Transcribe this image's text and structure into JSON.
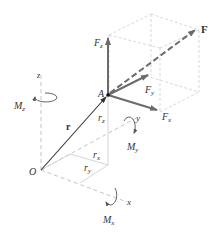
{
  "diagram": {
    "type": "3d-moment-components",
    "colors": {
      "background": "#ffffff",
      "force": "#6b6b6b",
      "guide": "#c9c9c9",
      "axis": "#b5b5b5",
      "position_vector": "#333333",
      "text": "#333333"
    },
    "points": {
      "O": "origin",
      "A": "point of force application"
    },
    "labels": {
      "F": "F",
      "Fz": {
        "main": "F",
        "sub": "z"
      },
      "Fy": {
        "main": "F",
        "sub": "y"
      },
      "Fx": {
        "main": "F",
        "sub": "x"
      },
      "A": "A",
      "O": "O",
      "r": "r",
      "rz": {
        "main": "r",
        "sub": "z"
      },
      "rx": {
        "main": "r",
        "sub": "x"
      },
      "ry": {
        "main": "r",
        "sub": "y"
      },
      "Mz": {
        "main": "M",
        "sub": "z"
      },
      "My": {
        "main": "M",
        "sub": "y"
      },
      "Mx": {
        "main": "M",
        "sub": "x"
      },
      "axis_z": "z",
      "axis_y": "y",
      "axis_x": "x"
    },
    "vectors": [
      {
        "name": "F",
        "style": "dashed",
        "from": "A",
        "to": "F-tip"
      },
      {
        "name": "Fz",
        "style": "solid",
        "from": "A",
        "direction": "up"
      },
      {
        "name": "Fy",
        "style": "solid",
        "from": "A",
        "direction": "back-right"
      },
      {
        "name": "Fx",
        "style": "solid",
        "from": "A",
        "direction": "front-right"
      },
      {
        "name": "r",
        "style": "solid",
        "from": "O",
        "to": "A"
      }
    ],
    "moments": [
      "Mx",
      "My",
      "Mz"
    ]
  }
}
